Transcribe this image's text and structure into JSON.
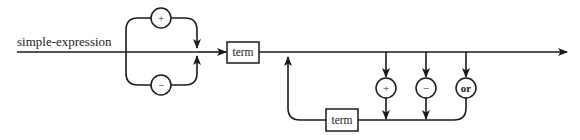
{
  "diagram": {
    "type": "syntax-diagram",
    "title": "simple-expression",
    "sign_options": [
      "+",
      "−"
    ],
    "first_term": "term",
    "loop_term": "term",
    "operators": [
      "+",
      "−",
      "or"
    ]
  },
  "colors": {
    "line": "#1a1a1a",
    "background": "#ffffff"
  }
}
